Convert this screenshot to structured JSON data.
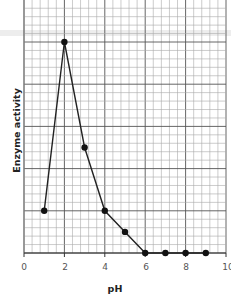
{
  "chart_data": {
    "type": "line",
    "title": "",
    "xlabel": "pH",
    "ylabel": "Enzyme activity",
    "x": [
      1,
      2,
      3,
      4,
      5,
      6,
      7,
      8,
      9
    ],
    "series": [
      {
        "name": "Enzyme activity",
        "values": [
          1,
          5,
          2.5,
          1,
          0.5,
          0,
          0,
          0,
          0
        ]
      }
    ],
    "xlim": [
      0,
      10
    ],
    "ylim": [
      0,
      6
    ],
    "xticks": [
      "0",
      "2",
      "4",
      "6",
      "8",
      "10"
    ],
    "yticks": [],
    "grid": true,
    "legend": null,
    "markers": "filled-circle",
    "line_color": "#222222"
  },
  "axes": {
    "xlabel": "pH",
    "ylabel": "Enzyme activity",
    "xticks": [
      "0",
      "2",
      "4",
      "6",
      "8",
      "10"
    ]
  }
}
